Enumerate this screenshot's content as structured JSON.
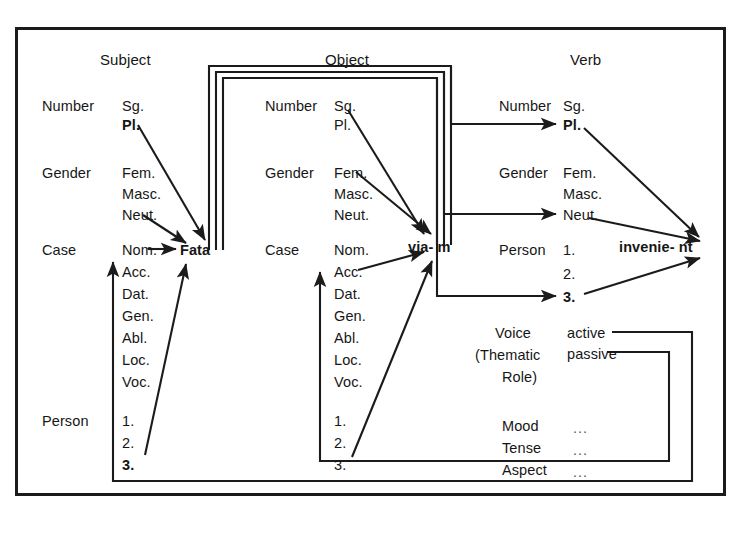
{
  "diagram": {
    "columns": [
      {
        "id": "subject",
        "title": "Subject",
        "word": "Fata",
        "groups": [
          {
            "label": "Number",
            "values": [
              {
                "text": "Sg.",
                "bold": false
              },
              {
                "text": "Pl.",
                "bold": true
              }
            ]
          },
          {
            "label": "Gender",
            "values": [
              {
                "text": "Fem.",
                "bold": false
              },
              {
                "text": "Masc.",
                "bold": false
              },
              {
                "text": "Neut.",
                "bold": false
              }
            ]
          },
          {
            "label": "Case",
            "values": [
              {
                "text": "Nom.",
                "bold": false
              },
              {
                "text": "Acc.",
                "bold": false
              },
              {
                "text": "Dat.",
                "bold": false
              },
              {
                "text": "Gen.",
                "bold": false
              },
              {
                "text": "Abl.",
                "bold": false
              },
              {
                "text": "Loc.",
                "bold": false
              },
              {
                "text": "Voc.",
                "bold": false
              }
            ]
          },
          {
            "label": "Person",
            "values": [
              {
                "text": "1.",
                "bold": false
              },
              {
                "text": "2.",
                "bold": false
              },
              {
                "text": "3.",
                "bold": true
              }
            ]
          }
        ]
      },
      {
        "id": "object",
        "title": "Object",
        "word": "via- m",
        "groups": [
          {
            "label": "Number",
            "values": [
              {
                "text": "Sg.",
                "bold": false
              },
              {
                "text": "Pl.",
                "bold": false
              }
            ]
          },
          {
            "label": "Gender",
            "values": [
              {
                "text": "Fem.",
                "bold": false
              },
              {
                "text": "Masc.",
                "bold": false
              },
              {
                "text": "Neut.",
                "bold": false
              }
            ]
          },
          {
            "label": "Case",
            "values": [
              {
                "text": "Nom.",
                "bold": false
              },
              {
                "text": "Acc.",
                "bold": false
              },
              {
                "text": "Dat.",
                "bold": false
              },
              {
                "text": "Gen.",
                "bold": false
              },
              {
                "text": "Abl.",
                "bold": false
              },
              {
                "text": "Loc.",
                "bold": false
              },
              {
                "text": "Voc.",
                "bold": false
              }
            ]
          },
          {
            "label": "",
            "values": [
              {
                "text": "1.",
                "bold": false
              },
              {
                "text": "2.",
                "bold": false
              },
              {
                "text": "3.",
                "bold": false
              }
            ]
          }
        ]
      },
      {
        "id": "verb",
        "title": "Verb",
        "word": "invenie- nt",
        "groups": [
          {
            "label": "Number",
            "values": [
              {
                "text": "Sg.",
                "bold": false
              },
              {
                "text": "Pl.",
                "bold": true
              }
            ]
          },
          {
            "label": "Gender",
            "values": [
              {
                "text": "Fem.",
                "bold": false
              },
              {
                "text": "Masc.",
                "bold": false
              },
              {
                "text": "Neut.",
                "bold": false
              }
            ]
          },
          {
            "label": "Person",
            "values": [
              {
                "text": "1.",
                "bold": false
              },
              {
                "text": "2.",
                "bold": false
              },
              {
                "text": "3.",
                "bold": true
              }
            ]
          }
        ]
      }
    ],
    "voice_box": {
      "label_line1": "Voice",
      "label_line2": "(Thematic",
      "label_line3": "Role)",
      "values": [
        {
          "text": "active"
        },
        {
          "text": "passive"
        }
      ],
      "extra_rows": [
        {
          "label": "Mood",
          "value": "..."
        },
        {
          "label": "Tense",
          "value": "..."
        },
        {
          "label": "Aspect",
          "value": "..."
        }
      ]
    },
    "colors": {
      "ink": "#161616",
      "line": "#1b1b1b",
      "background": "#ffffff"
    }
  }
}
